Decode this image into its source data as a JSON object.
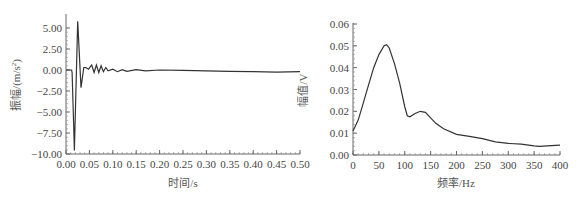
{
  "chart_data": [
    {
      "type": "line",
      "title": "",
      "xlabel": "时间/s",
      "ylabel": "振幅/(m/s²)",
      "ylabel_parts": {
        "main": "振幅/(m/s",
        "sup": "2",
        "close": ")"
      },
      "xlim": [
        0,
        0.5
      ],
      "ylim": [
        -10,
        6.5
      ],
      "grid": false,
      "x_ticks": [
        "0.00",
        "0.05",
        "0.10",
        "0.15",
        "0.20",
        "0.25",
        "0.30",
        "0.35",
        "0.40",
        "0.45",
        "0.50"
      ],
      "y_ticks": [
        "5.00",
        "2.50",
        "0.00",
        "-2.50",
        "-5.00",
        "-7.50",
        "-10.00"
      ],
      "x": [
        0,
        0.012,
        0.013,
        0.018,
        0.025,
        0.032,
        0.038,
        0.042,
        0.048,
        0.055,
        0.06,
        0.065,
        0.07,
        0.075,
        0.08,
        0.085,
        0.09,
        0.1,
        0.11,
        0.12,
        0.13,
        0.15,
        0.17,
        0.2,
        0.25,
        0.3,
        0.35,
        0.4,
        0.45,
        0.5
      ],
      "y": [
        0,
        0,
        -0.3,
        -9.6,
        5.8,
        -2.1,
        0.3,
        0.3,
        0.1,
        0.6,
        -0.3,
        0.6,
        -0.3,
        0.5,
        -0.2,
        0.3,
        -0.1,
        0.1,
        -0.2,
        0.05,
        -0.15,
        0.05,
        -0.1,
        0.0,
        -0.05,
        -0.1,
        -0.15,
        -0.2,
        -0.25,
        -0.2
      ]
    },
    {
      "type": "line",
      "title": "",
      "xlabel": "频率/Hz",
      "ylabel": "幅值/V",
      "xlim": [
        0,
        400
      ],
      "ylim": [
        0,
        0.06
      ],
      "grid": false,
      "x_ticks": [
        "0",
        "50",
        "100",
        "150",
        "200",
        "250",
        "300",
        "350",
        "400"
      ],
      "y_ticks": [
        "0.06",
        "0.05",
        "0.04",
        "0.03",
        "0.02",
        "0.01",
        "0.00"
      ],
      "x": [
        0,
        10,
        20,
        30,
        40,
        50,
        60,
        65,
        70,
        80,
        90,
        100,
        105,
        110,
        120,
        130,
        140,
        150,
        160,
        175,
        200,
        225,
        250,
        275,
        300,
        325,
        350,
        360,
        375,
        400
      ],
      "y": [
        0.011,
        0.016,
        0.024,
        0.032,
        0.04,
        0.046,
        0.05,
        0.0505,
        0.049,
        0.042,
        0.033,
        0.022,
        0.018,
        0.0175,
        0.019,
        0.02,
        0.0195,
        0.017,
        0.0145,
        0.012,
        0.0095,
        0.0085,
        0.0075,
        0.006,
        0.0053,
        0.005,
        0.0042,
        0.004,
        0.0042,
        0.0045
      ]
    }
  ]
}
